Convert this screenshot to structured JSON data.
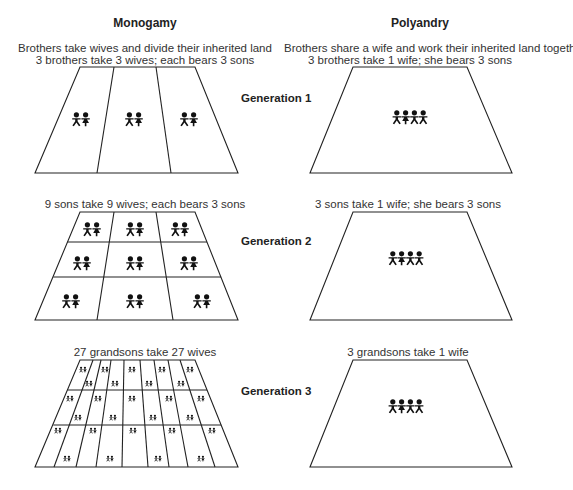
{
  "columns": {
    "monogamy": {
      "title": "Monogamy",
      "subtitle": "Brothers take wives and divide their inherited land",
      "generations": [
        {
          "caption": "3 brothers take 3 wives; each bears 3 sons",
          "plots": 3,
          "couples": 3
        },
        {
          "caption": "9 sons take 9 wives; each bears 3 sons",
          "plots": 9,
          "couples": 9
        },
        {
          "caption": "27 grandsons take 27 wives",
          "plots": 27,
          "couples": 27
        }
      ]
    },
    "polyandry": {
      "title": "Polyandry",
      "subtitle": "Brothers share a wife and work their inherited land together",
      "generations": [
        {
          "caption": "3 brothers take 1 wife; she bears 3 sons",
          "plots": 1,
          "people": 4
        },
        {
          "caption": "3 sons take 1 wife; she bears 3 sons",
          "plots": 1,
          "people": 4
        },
        {
          "caption": "3 grandsons take 1 wife",
          "plots": 1,
          "people": 4
        }
      ]
    }
  },
  "generation_labels": [
    "Generation 1",
    "Generation 2",
    "Generation 3"
  ],
  "icons": {
    "man": "man-figure-icon",
    "woman": "woman-figure-icon"
  },
  "colors": {
    "ink": "#222222",
    "background": "#ffffff"
  }
}
